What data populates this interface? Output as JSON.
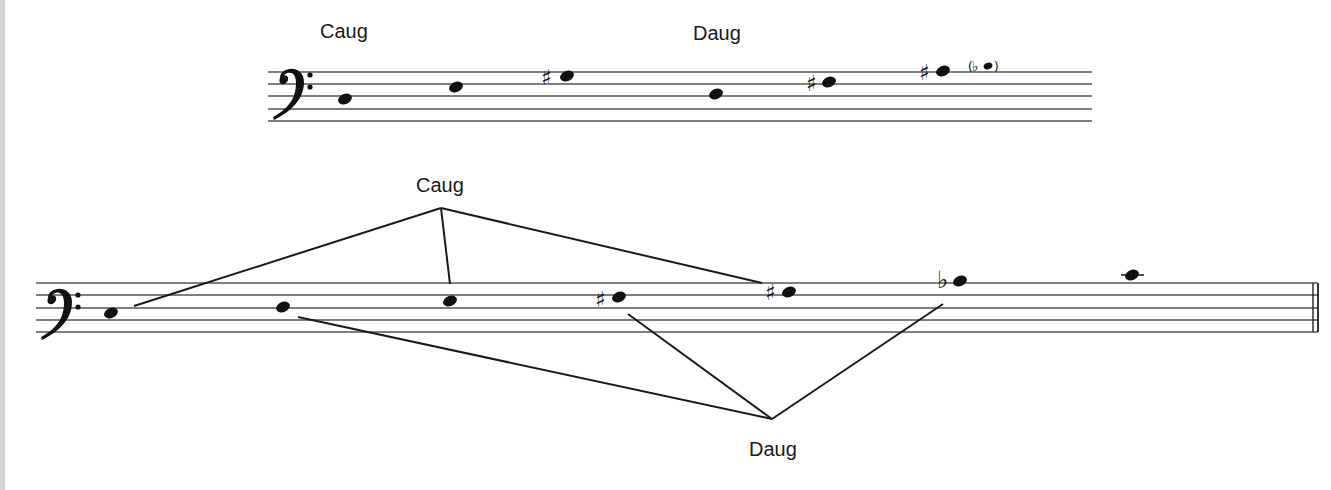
{
  "figure": {
    "background": "#ffffff",
    "left_edge_color": "#d4d4d4",
    "ink_color": "#111111"
  },
  "top_staff": {
    "clef": "bass-clef",
    "groups": [
      {
        "label": "Caug",
        "notes": [
          "C",
          "E",
          "G#"
        ]
      },
      {
        "label": "Daug",
        "notes": [
          "D",
          "F#",
          "A#"
        ],
        "enharmonic": "(Bb)"
      }
    ],
    "label_caug": "Caug",
    "label_daug": "Daug",
    "notes": [
      {
        "name": "C",
        "accidental": ""
      },
      {
        "name": "E",
        "accidental": ""
      },
      {
        "name": "G#",
        "accidental": "sharp"
      },
      {
        "name": "D",
        "accidental": ""
      },
      {
        "name": "F#",
        "accidental": "sharp"
      },
      {
        "name": "A#",
        "accidental": "sharp"
      },
      {
        "name": "(Bb)",
        "accidental": "flat",
        "parenthesized": true
      }
    ],
    "accidental_glyphs": {
      "sharp": "♯",
      "flat": "♭",
      "paren_open": "(",
      "paren_close": ")"
    }
  },
  "bottom_staff": {
    "clef": "bass-clef",
    "label_caug": "Caug",
    "label_daug": "Daug",
    "notes": [
      {
        "name": "C",
        "accidental": ""
      },
      {
        "name": "D",
        "accidental": ""
      },
      {
        "name": "E",
        "accidental": ""
      },
      {
        "name": "F#",
        "accidental": "sharp"
      },
      {
        "name": "G#",
        "accidental": "sharp"
      },
      {
        "name": "Bb",
        "accidental": "flat"
      },
      {
        "name": "C",
        "accidental": "",
        "ledger_line": true
      }
    ],
    "caug_connects": [
      "C",
      "E",
      "G#"
    ],
    "daug_connects": [
      "D",
      "F#",
      "Bb"
    ],
    "ending": "final-double-barline",
    "accidental_glyphs": {
      "sharp": "♯",
      "flat": "♭"
    }
  }
}
